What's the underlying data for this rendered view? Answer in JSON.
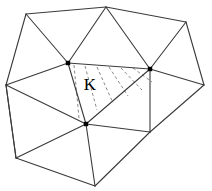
{
  "figure": {
    "width": 212,
    "height": 191,
    "background_color": "#ffffff",
    "edge_color": "#3a3a3a",
    "hatch_color": "#8a8a8a",
    "node_color": "#000000",
    "label_color": "#000000"
  },
  "labels": {
    "cell_k": "K"
  },
  "chart_data": {
    "type": "diagram",
    "vertices": [
      {
        "id": "v-top-left",
        "x": 26,
        "y": 14,
        "node_marker": false
      },
      {
        "id": "v-top-center",
        "x": 106,
        "y": 7,
        "node_marker": false
      },
      {
        "id": "v-top-right",
        "x": 186,
        "y": 22,
        "node_marker": false
      },
      {
        "id": "v-right",
        "x": 204,
        "y": 85,
        "node_marker": false
      },
      {
        "id": "v-left",
        "x": 6,
        "y": 85,
        "node_marker": false
      },
      {
        "id": "v-bottom-left",
        "x": 16,
        "y": 158,
        "node_marker": false
      },
      {
        "id": "v-bottom",
        "x": 95,
        "y": 186,
        "node_marker": false
      },
      {
        "id": "k-apex-left",
        "x": 68,
        "y": 63,
        "node_marker": true
      },
      {
        "id": "k-apex-right",
        "x": 150,
        "y": 69,
        "node_marker": true
      },
      {
        "id": "k-apex-bottom",
        "x": 86,
        "y": 124,
        "node_marker": true
      },
      {
        "id": "v-mid-right",
        "x": 150,
        "y": 132,
        "node_marker": false
      }
    ],
    "edges": [
      {
        "from": "v-top-left",
        "to": "v-top-center"
      },
      {
        "from": "v-top-center",
        "to": "v-top-right"
      },
      {
        "from": "v-top-right",
        "to": "v-right"
      },
      {
        "from": "v-right",
        "to": "v-mid-right"
      },
      {
        "from": "v-mid-right",
        "to": "v-bottom"
      },
      {
        "from": "v-bottom",
        "to": "v-bottom-left"
      },
      {
        "from": "v-bottom-left",
        "to": "v-left"
      },
      {
        "from": "v-left",
        "to": "v-top-left"
      },
      {
        "from": "v-top-left",
        "to": "k-apex-left"
      },
      {
        "from": "v-top-center",
        "to": "k-apex-left"
      },
      {
        "from": "v-top-center",
        "to": "k-apex-right"
      },
      {
        "from": "v-top-right",
        "to": "k-apex-right"
      },
      {
        "from": "v-right",
        "to": "k-apex-right"
      },
      {
        "from": "v-left",
        "to": "k-apex-left"
      },
      {
        "from": "v-left",
        "to": "k-apex-bottom"
      },
      {
        "from": "v-left",
        "to": "v-bottom-left"
      },
      {
        "from": "v-bottom-left",
        "to": "k-apex-bottom"
      },
      {
        "from": "v-bottom",
        "to": "k-apex-bottom"
      },
      {
        "from": "k-apex-left",
        "to": "k-apex-right"
      },
      {
        "from": "k-apex-left",
        "to": "k-apex-bottom"
      },
      {
        "from": "k-apex-bottom",
        "to": "k-apex-right"
      },
      {
        "from": "k-apex-right",
        "to": "v-mid-right"
      },
      {
        "from": "k-apex-bottom",
        "to": "v-mid-right"
      }
    ],
    "highlighted_cell": {
      "label": "K",
      "vertices": [
        "k-apex-left",
        "k-apex-right",
        "k-apex-bottom"
      ],
      "fill": "hatched-dashed",
      "label_position": {
        "x": 90,
        "y": 90
      }
    },
    "hatch_lines": [
      {
        "x1": 74,
        "y1": 65,
        "x2": 79,
        "y2": 118
      },
      {
        "x1": 85,
        "y1": 66,
        "x2": 97,
        "y2": 110
      },
      {
        "x1": 97,
        "y1": 67,
        "x2": 113,
        "y2": 103
      },
      {
        "x1": 109,
        "y1": 67,
        "x2": 128,
        "y2": 96
      },
      {
        "x1": 121,
        "y1": 68,
        "x2": 142,
        "y2": 90
      },
      {
        "x1": 133,
        "y1": 68,
        "x2": 152,
        "y2": 82
      }
    ]
  }
}
